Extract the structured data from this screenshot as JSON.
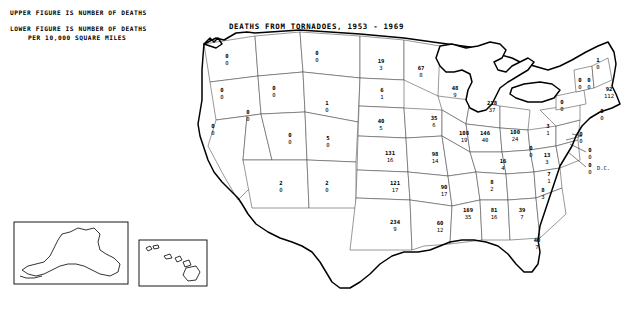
{
  "title": "DEATHS FROM TORNADOES, 1953 - 1969",
  "legend": {
    "line1": "UPPER FIGURE IS NUMBER OF DEATHS",
    "line2": "LOWER FIGURE IS NUMBER OF DEATHS",
    "line3": "PER 10,000 SQUARE MILES"
  },
  "dc_label": "D.C.",
  "chart_data": {
    "type": "map",
    "title": "DEATHS FROM TORNADOES, 1953 - 1969",
    "upper_value_meaning": "number of deaths",
    "lower_value_meaning": "number of deaths per 10,000 square miles",
    "categories": [
      "WA",
      "OR",
      "CA",
      "NV",
      "ID",
      "MT",
      "WY",
      "UT",
      "AZ",
      "NM",
      "CO",
      "ND",
      "SD",
      "NE",
      "KS",
      "OK",
      "TX",
      "MN",
      "IA",
      "MO",
      "AR",
      "LA",
      "WI",
      "IL",
      "MI",
      "IN",
      "OH",
      "KY",
      "TN",
      "MS",
      "AL",
      "GA",
      "FL",
      "SC",
      "NC",
      "VA",
      "WV",
      "PA",
      "NY",
      "ME",
      "NH",
      "VT",
      "MA",
      "RI",
      "CT",
      "NJ",
      "DE",
      "MD",
      "DC",
      "AK",
      "HI"
    ],
    "states": [
      {
        "code": "WA",
        "upper": 0,
        "lower": 0,
        "x": 227,
        "y": 58
      },
      {
        "code": "OR",
        "upper": 0,
        "lower": 0,
        "x": 222,
        "y": 92
      },
      {
        "code": "CA",
        "upper": 0,
        "lower": 0,
        "x": 213,
        "y": 128
      },
      {
        "code": "NV",
        "upper": 0,
        "lower": 0,
        "x": 248,
        "y": 114
      },
      {
        "code": "ID",
        "upper": 0,
        "lower": 0,
        "x": 274,
        "y": 90
      },
      {
        "code": "MT",
        "upper": 0,
        "lower": 0,
        "x": 317,
        "y": 55
      },
      {
        "code": "WY",
        "upper": 1,
        "lower": 0,
        "x": 327,
        "y": 105
      },
      {
        "code": "UT",
        "upper": 0,
        "lower": 0,
        "x": 290,
        "y": 137
      },
      {
        "code": "AZ",
        "upper": 2,
        "lower": 0,
        "x": 281,
        "y": 185
      },
      {
        "code": "NM",
        "upper": 2,
        "lower": 0,
        "x": 327,
        "y": 185
      },
      {
        "code": "CO",
        "upper": 5,
        "lower": 0,
        "x": 328,
        "y": 140
      },
      {
        "code": "ND",
        "upper": 19,
        "lower": 3,
        "x": 381,
        "y": 63
      },
      {
        "code": "SD",
        "upper": 6,
        "lower": 1,
        "x": 382,
        "y": 92
      },
      {
        "code": "NE",
        "upper": 40,
        "lower": 5,
        "x": 381,
        "y": 123
      },
      {
        "code": "KS",
        "upper": 131,
        "lower": 16,
        "x": 390,
        "y": 155
      },
      {
        "code": "OK",
        "upper": 121,
        "lower": 17,
        "x": 395,
        "y": 185
      },
      {
        "code": "TX",
        "upper": 234,
        "lower": 9,
        "x": 395,
        "y": 224
      },
      {
        "code": "MN",
        "upper": 67,
        "lower": 8,
        "x": 421,
        "y": 70
      },
      {
        "code": "IA",
        "upper": 35,
        "lower": 6,
        "x": 434,
        "y": 120
      },
      {
        "code": "MO",
        "upper": 98,
        "lower": 14,
        "x": 435,
        "y": 156
      },
      {
        "code": "AR",
        "upper": 90,
        "lower": 17,
        "x": 444,
        "y": 189
      },
      {
        "code": "LA",
        "upper": 60,
        "lower": 12,
        "x": 440,
        "y": 225
      },
      {
        "code": "WI",
        "upper": 48,
        "lower": 9,
        "x": 455,
        "y": 90
      },
      {
        "code": "IL",
        "upper": 108,
        "lower": 19,
        "x": 464,
        "y": 135
      },
      {
        "code": "MI",
        "upper": 218,
        "lower": 37,
        "x": 492,
        "y": 105
      },
      {
        "code": "IN",
        "upper": 146,
        "lower": 40,
        "x": 485,
        "y": 135
      },
      {
        "code": "OH",
        "upper": 100,
        "lower": 24,
        "x": 515,
        "y": 134
      },
      {
        "code": "KY",
        "upper": 16,
        "lower": 4,
        "x": 503,
        "y": 163
      },
      {
        "code": "TN",
        "upper": 8,
        "lower": 2,
        "x": 492,
        "y": 184
      },
      {
        "code": "MS",
        "upper": 169,
        "lower": 35,
        "x": 468,
        "y": 212
      },
      {
        "code": "AL",
        "upper": 81,
        "lower": 16,
        "x": 494,
        "y": 212
      },
      {
        "code": "GA",
        "upper": 39,
        "lower": 7,
        "x": 522,
        "y": 212
      },
      {
        "code": "FL",
        "upper": 40,
        "lower": 7,
        "x": 537,
        "y": 242
      },
      {
        "code": "SC",
        "upper": 8,
        "lower": 3,
        "x": 543,
        "y": 192
      },
      {
        "code": "NC",
        "upper": 7,
        "lower": 1,
        "x": 549,
        "y": 176
      },
      {
        "code": "VA",
        "upper": 13,
        "lower": 3,
        "x": 547,
        "y": 157
      },
      {
        "code": "WV",
        "upper": 0,
        "lower": 0,
        "x": 531,
        "y": 150
      },
      {
        "code": "PA",
        "upper": 3,
        "lower": 1,
        "x": 548,
        "y": 128
      },
      {
        "code": "NY",
        "upper": 0,
        "lower": 0,
        "x": 562,
        "y": 104
      },
      {
        "code": "ME",
        "upper": 1,
        "lower": 0,
        "x": 598,
        "y": 62
      },
      {
        "code": "NH",
        "upper": 0,
        "lower": 0,
        "x": 589,
        "y": 82
      },
      {
        "code": "VT",
        "upper": 0,
        "lower": 0,
        "x": 580,
        "y": 82
      },
      {
        "code": "MA",
        "upper": 92,
        "lower": 112,
        "x": 609,
        "y": 91
      },
      {
        "code": "CT",
        "upper": 0,
        "lower": 0,
        "x": 602,
        "y": 113
      },
      {
        "code": "NJ",
        "upper": 0,
        "lower": 0,
        "x": 581,
        "y": 136
      },
      {
        "code": "DE",
        "upper": 0,
        "lower": 0,
        "x": 590,
        "y": 152
      },
      {
        "code": "MD",
        "upper": 0,
        "lower": 0,
        "x": 590,
        "y": 167
      },
      {
        "code": "AK",
        "upper": 0,
        "lower": 0,
        "x": 86,
        "y": 243
      },
      {
        "code": "HI",
        "upper": null,
        "lower": null,
        "x": 0,
        "y": 0
      }
    ]
  }
}
